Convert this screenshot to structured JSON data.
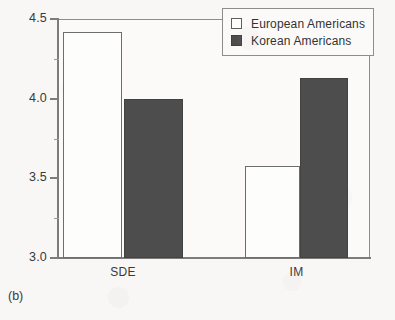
{
  "caption": "(b)",
  "legend": {
    "position": "top-right-inside",
    "entries": [
      {
        "label": "European Americans",
        "swatch": "open-square",
        "color": "#fdfdfc"
      },
      {
        "label": "Korean Americans",
        "swatch": "filled-square",
        "color": "#4d4d4d"
      }
    ]
  },
  "axis": {
    "y_major_labels": [
      "4.5",
      "4.0",
      "3.5",
      "3.0"
    ],
    "y_major_values": [
      4.5,
      4.0,
      3.5,
      3.0
    ],
    "y_minor_values": [
      4.25,
      3.75,
      3.25
    ],
    "x_labels": [
      "SDE",
      "IM"
    ]
  },
  "chart_data": {
    "type": "bar",
    "title": "",
    "subtitle": "",
    "xlabel": "",
    "ylabel": "",
    "categories": [
      "SDE",
      "IM"
    ],
    "series": [
      {
        "name": "European Americans",
        "values": [
          4.42,
          3.58
        ],
        "style": "open",
        "color": "#fdfdfc"
      },
      {
        "name": "Korean Americans",
        "values": [
          4.0,
          4.13
        ],
        "style": "filled",
        "color": "#4d4d4d"
      }
    ],
    "ylim": [
      3.0,
      4.5
    ],
    "ytick_step": 0.5,
    "yminor_step": 0.25,
    "grid": false,
    "legend_position": "top right, inside axes",
    "annotations": [
      "(b)"
    ]
  },
  "geometry": {
    "plot": {
      "left": 57,
      "top": 19,
      "right": 370,
      "bottom": 258
    },
    "bars": [
      {
        "series": 0,
        "category": 0,
        "x": 63,
        "width": 59
      },
      {
        "series": 1,
        "category": 0,
        "x": 124,
        "width": 59
      },
      {
        "series": 0,
        "category": 1,
        "x": 245,
        "width": 55
      },
      {
        "series": 1,
        "category": 1,
        "x": 300,
        "width": 48
      }
    ]
  }
}
